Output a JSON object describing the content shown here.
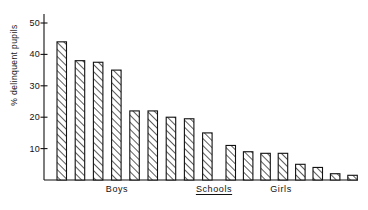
{
  "chart_data": {
    "type": "bar",
    "title": "",
    "xlabel": "Schools",
    "ylabel": "% delinquent pupils",
    "ylim": [
      0,
      53
    ],
    "yticks": [
      10,
      20,
      30,
      40,
      50
    ],
    "ytick_labels": [
      "10",
      "20",
      "30",
      "40",
      "50"
    ],
    "grid": false,
    "legend": null,
    "group_labels": [
      "Boys",
      "Schools",
      "Girls"
    ],
    "bar_style": "diagonal-hatch",
    "groups": [
      {
        "name": "Boys",
        "label": "Boys",
        "categories": [
          "1",
          "2",
          "3",
          "4",
          "5",
          "6",
          "7",
          "8",
          "9"
        ],
        "values": [
          44,
          38,
          37.5,
          35,
          22,
          22,
          20,
          19.5,
          15
        ]
      },
      {
        "name": "Girls",
        "label": "Girls",
        "categories": [
          "1",
          "2",
          "3",
          "4",
          "5",
          "6",
          "7",
          "8"
        ],
        "values": [
          11,
          9,
          8.5,
          8.5,
          5,
          4,
          2,
          1.5
        ]
      }
    ],
    "annotations": []
  },
  "axis": {
    "center_label": "Schools",
    "center_label_underlined": true
  },
  "colors": {
    "ink": "#111111",
    "background": "#ffffff",
    "hatch": "#222222"
  }
}
